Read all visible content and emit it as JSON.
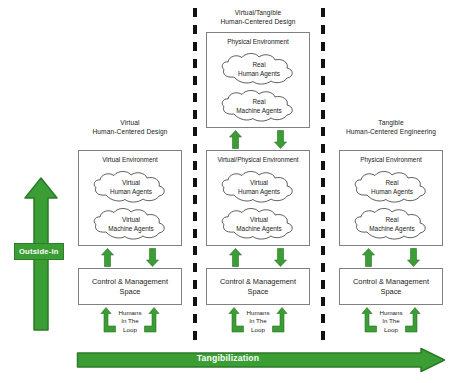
{
  "figure": {
    "background_color": "#ffffff",
    "accent_green": "#3a9e35",
    "box_border_color": "#808080",
    "divider_color": "#111111"
  },
  "axes": {
    "vertical_arrow_label": "Outside-in",
    "horizontal_arrow_label": "Tangibilization"
  },
  "columns": [
    {
      "caption_line1": "Virtual",
      "caption_line2": "Human-Centered Design",
      "environments": [
        {
          "title": "Virtual Environment",
          "clouds": [
            {
              "line1": "Virtual",
              "line2": "Human Agents"
            },
            {
              "line1": "Virtual",
              "line2": "Machine Agents"
            }
          ]
        }
      ],
      "control_space": {
        "line1": "Control & Management",
        "line2": "Space"
      },
      "humans_in_the_loop": {
        "line1": "Humans",
        "line2": "In The",
        "line3": "Loop"
      }
    },
    {
      "caption_line1": "Virtual/Tangible",
      "caption_line2": "Human-Centered Design",
      "environments": [
        {
          "title": "Physical Environment",
          "clouds": [
            {
              "line1": "Real",
              "line2": "Human Agents"
            },
            {
              "line1": "Real",
              "line2": "Machine Agents"
            }
          ]
        },
        {
          "title": "Virtual/Physical Environment",
          "clouds": [
            {
              "line1": "Virtual",
              "line2": "Human Agents"
            },
            {
              "line1": "Virtual",
              "line2": "Machine Agents"
            }
          ]
        }
      ],
      "control_space": {
        "line1": "Control & Management",
        "line2": "Space"
      },
      "humans_in_the_loop": {
        "line1": "Humans",
        "line2": "In The",
        "line3": "Loop"
      }
    },
    {
      "caption_line1": "Tangible",
      "caption_line2": "Human-Centered Engineering",
      "environments": [
        {
          "title": "Physical Environment",
          "clouds": [
            {
              "line1": "Real",
              "line2": "Human Agents"
            },
            {
              "line1": "Real",
              "line2": "Machine Agents"
            }
          ]
        }
      ],
      "control_space": {
        "line1": "Control & Management",
        "line2": "Space"
      },
      "humans_in_the_loop": {
        "line1": "Humans",
        "line2": "In The",
        "line3": "Loop"
      }
    }
  ]
}
